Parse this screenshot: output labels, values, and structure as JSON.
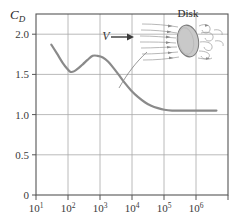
{
  "chart_data": {
    "type": "line",
    "title": "",
    "xlabel": "",
    "ylabel": "C_D",
    "xscale": "log",
    "yscale": "linear",
    "xlim": [
      10,
      1000000
    ],
    "ylim": [
      0,
      2.25
    ],
    "grid": true,
    "legend": null,
    "x_tick_labels": [
      "10",
      "10",
      "10",
      "10",
      "10",
      "10"
    ],
    "x_tick_exponents": [
      "1",
      "2",
      "3",
      "4",
      "5",
      "6"
    ],
    "x_tick_values": [
      10,
      100,
      1000,
      10000,
      100000,
      1000000
    ],
    "y_tick_labels": [
      "0",
      "0.5",
      "1.0",
      "1.5",
      "2.0"
    ],
    "y_tick_values": [
      0,
      0.5,
      1.0,
      1.5,
      2.0
    ],
    "series": [
      {
        "name": "Disk drag coefficient",
        "color": "#8a8a8a",
        "x": [
          25,
          35,
          50,
          65,
          80,
          100,
          130,
          170,
          220,
          300,
          400,
          550,
          750,
          1000,
          1400,
          2000,
          3000,
          4500,
          7000,
          10000,
          15000,
          22000,
          35000,
          60000,
          120000,
          250000,
          500000
        ],
        "y": [
          1.87,
          1.76,
          1.64,
          1.57,
          1.53,
          1.54,
          1.58,
          1.63,
          1.68,
          1.73,
          1.73,
          1.71,
          1.66,
          1.59,
          1.5,
          1.4,
          1.3,
          1.22,
          1.15,
          1.11,
          1.08,
          1.06,
          1.05,
          1.05,
          1.05,
          1.05,
          1.05
        ]
      }
    ],
    "annotations": [
      {
        "name": "disk-inset-label",
        "text": "Disk"
      },
      {
        "name": "velocity-symbol",
        "text": "V"
      }
    ]
  },
  "axes": {
    "y_title": "C",
    "y_title_sub": "D"
  },
  "inset": {
    "label": "Disk",
    "velocity_symbol": "V",
    "disk_fill": "#c9c9c9",
    "streamline_color": "#8f8f8f"
  },
  "style": {
    "curve_color": "#8a8a8a",
    "grid_color": "#a8a8a8",
    "frame_color": "#555555",
    "background": "#ffffff",
    "tick_text_color": "#3a3a3a"
  }
}
